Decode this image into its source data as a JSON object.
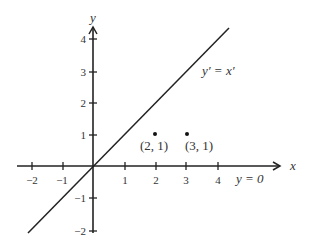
{
  "diagram": {
    "type": "coordinate-plane",
    "colors": {
      "ink": "#222222",
      "text": "#333333",
      "background": "#ffffff"
    },
    "axes": {
      "x_label": "x",
      "y_label": "y",
      "x_ticks": [
        "−2",
        "−1",
        "1",
        "2",
        "3",
        "4"
      ],
      "y_ticks": [
        "4",
        "3",
        "2",
        "1",
        "−1",
        "−2"
      ],
      "x_range": [
        -2.4,
        6
      ],
      "y_range": [
        -2.1,
        4.5
      ]
    },
    "line": {
      "label": "y′ = x′",
      "from": [
        -2.1,
        -2.1
      ],
      "to": [
        4.3,
        4.3
      ]
    },
    "x_axis_annotation": "y = 0",
    "points": [
      {
        "x": 2,
        "y": 1,
        "label": "(2, 1)"
      },
      {
        "x": 3,
        "y": 1,
        "label": "(3, 1)"
      }
    ]
  }
}
